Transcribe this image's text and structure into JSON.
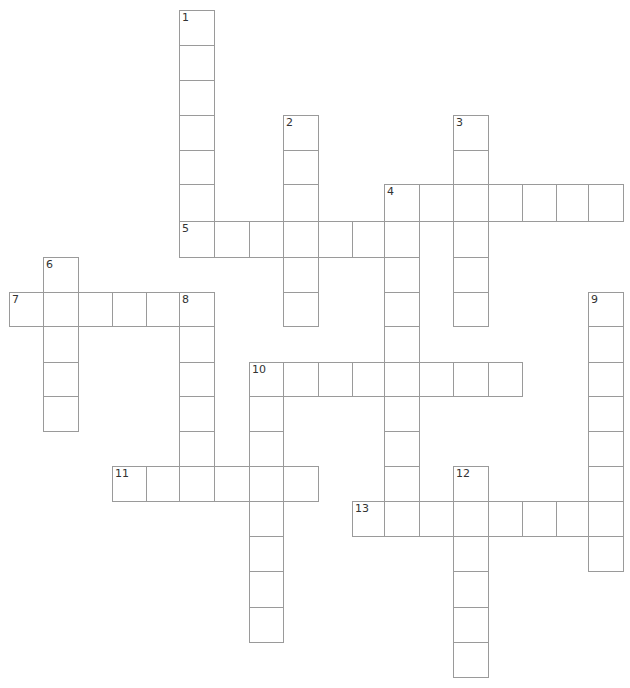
{
  "puzzle": {
    "type": "crossword",
    "colors": {
      "grid_line": "#9a9a9a",
      "cell_background": "#ffffff",
      "number_text": "#333333"
    },
    "row_y": [
      10,
      45,
      80,
      115,
      150,
      184,
      221,
      257,
      292,
      326,
      362,
      396,
      431,
      466,
      501,
      536,
      571,
      607,
      642
    ],
    "col_x": [
      9,
      43,
      78,
      112,
      146,
      179,
      214,
      249,
      283,
      318,
      352,
      384,
      419,
      453,
      488,
      522,
      556,
      588
    ],
    "cell_size": 35,
    "words": [
      {
        "number": "1",
        "direction": "down",
        "row": 0,
        "col": 5,
        "length": 7
      },
      {
        "number": "2",
        "direction": "down",
        "row": 3,
        "col": 8,
        "length": 6
      },
      {
        "number": "3",
        "direction": "down",
        "row": 3,
        "col": 13,
        "length": 6
      },
      {
        "number": "4",
        "direction": "across",
        "row": 5,
        "col": 11,
        "length": 7
      },
      {
        "number": "4",
        "direction": "down",
        "row": 5,
        "col": 11,
        "length": 10
      },
      {
        "number": "5",
        "direction": "across",
        "row": 6,
        "col": 5,
        "length": 7
      },
      {
        "number": "6",
        "direction": "down",
        "row": 7,
        "col": 1,
        "length": 5
      },
      {
        "number": "7",
        "direction": "across",
        "row": 8,
        "col": 0,
        "length": 6
      },
      {
        "number": "8",
        "direction": "down",
        "row": 8,
        "col": 5,
        "length": 6
      },
      {
        "number": "9",
        "direction": "down",
        "row": 8,
        "col": 17,
        "length": 8
      },
      {
        "number": "10",
        "direction": "across",
        "row": 10,
        "col": 7,
        "length": 8
      },
      {
        "number": "10",
        "direction": "down",
        "row": 10,
        "col": 7,
        "length": 8
      },
      {
        "number": "11",
        "direction": "across",
        "row": 13,
        "col": 3,
        "length": 6
      },
      {
        "number": "12",
        "direction": "down",
        "row": 13,
        "col": 13,
        "length": 6
      },
      {
        "number": "13",
        "direction": "across",
        "row": 14,
        "col": 10,
        "length": 8
      }
    ],
    "numbers": [
      {
        "label": "1",
        "row": 0,
        "col": 5
      },
      {
        "label": "2",
        "row": 3,
        "col": 8
      },
      {
        "label": "3",
        "row": 3,
        "col": 13
      },
      {
        "label": "4",
        "row": 5,
        "col": 11
      },
      {
        "label": "5",
        "row": 6,
        "col": 5
      },
      {
        "label": "6",
        "row": 7,
        "col": 1
      },
      {
        "label": "7",
        "row": 8,
        "col": 0
      },
      {
        "label": "8",
        "row": 8,
        "col": 5
      },
      {
        "label": "9",
        "row": 8,
        "col": 17
      },
      {
        "label": "10",
        "row": 10,
        "col": 7
      },
      {
        "label": "11",
        "row": 13,
        "col": 3
      },
      {
        "label": "12",
        "row": 13,
        "col": 13
      },
      {
        "label": "13",
        "row": 14,
        "col": 10
      }
    ]
  }
}
